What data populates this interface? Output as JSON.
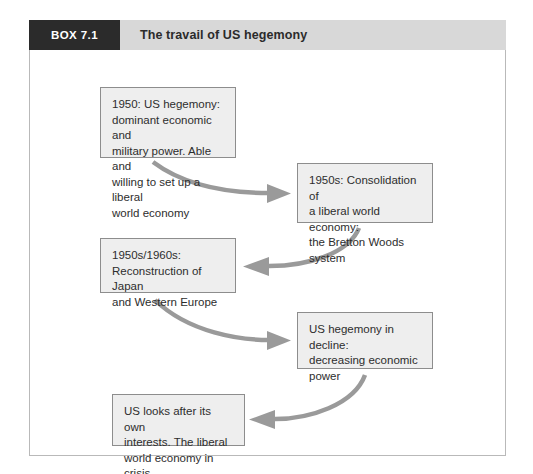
{
  "box": {
    "tag": "BOX 7.1",
    "title": "The travail of US hegemony"
  },
  "colors": {
    "tag_background": "#2b2b2b",
    "header_background": "#d8d8d8",
    "node_background": "#eeeeee",
    "node_border": "#8d8d8d",
    "arrow": "#9a9a9a",
    "frame_border": "#b9b9b9",
    "text": "#2d2d2d"
  },
  "diagram": {
    "type": "flowchart",
    "nodes": [
      {
        "id": "node-1",
        "text": "1950: US hegemony:\ndominant economic and\nmilitary power. Able and\nwilling to set up a liberal\nworld economy"
      },
      {
        "id": "node-2",
        "text": "1950s: Consolidation of\na liberal world economy:\nthe Bretton Woods\nsystem"
      },
      {
        "id": "node-3",
        "text": "1950s/1960s:\nReconstruction of Japan\nand Western Europe"
      },
      {
        "id": "node-4",
        "text": "US hegemony in decline:\ndecreasing economic\npower"
      },
      {
        "id": "node-5",
        "text": "US looks after its own\ninterests. The liberal\nworld economy in crisis"
      }
    ],
    "arrows": [
      {
        "id": "arrow-1",
        "from": "node-1",
        "to": "node-2",
        "direction": "right"
      },
      {
        "id": "arrow-2",
        "from": "node-2",
        "to": "node-3",
        "direction": "left"
      },
      {
        "id": "arrow-3",
        "from": "node-3",
        "to": "node-4",
        "direction": "right"
      },
      {
        "id": "arrow-4",
        "from": "node-4",
        "to": "node-5",
        "direction": "left"
      }
    ]
  }
}
